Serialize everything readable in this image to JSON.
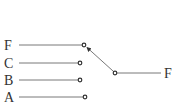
{
  "diagram": {
    "type": "selector-switch",
    "inputs": [
      {
        "label": "F",
        "y": 45,
        "node_x": 84
      },
      {
        "label": "C",
        "y": 63,
        "node_x": 80
      },
      {
        "label": "B",
        "y": 80,
        "node_x": 80
      },
      {
        "label": "A",
        "y": 97,
        "node_x": 85
      }
    ],
    "output": {
      "label": "F",
      "node_x": 115,
      "node_y": 73
    },
    "selected_input": "F"
  }
}
